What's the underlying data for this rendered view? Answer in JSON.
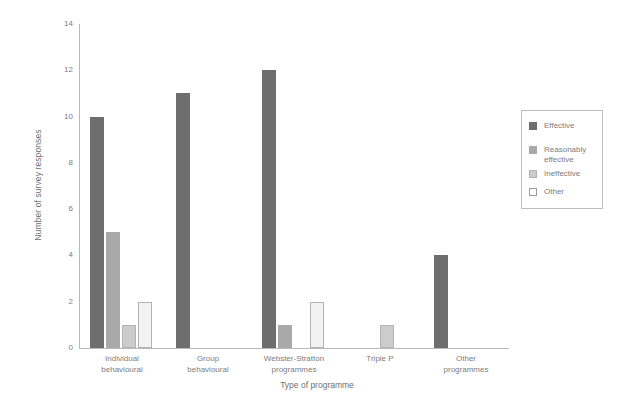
{
  "chart_data": {
    "type": "bar",
    "title": "",
    "xlabel": "Type of programme",
    "ylabel": "Number of survey responses",
    "ylim": [
      0,
      14
    ],
    "yticks": [
      0,
      2,
      4,
      6,
      8,
      10,
      12,
      14
    ],
    "grid": false,
    "legend_position": "right",
    "categories": [
      "Individual\nbehavioural",
      "Group\nbehavioural",
      "Webster-Stratton\nprogrammes",
      "Triple P",
      "Other\nprogrammes"
    ],
    "series": [
      {
        "name": "Effective",
        "color": "#6e6e6e",
        "values": [
          10,
          11,
          12,
          0,
          4
        ]
      },
      {
        "name": "Reasonably\neffective",
        "color": "#a9a9a9",
        "values": [
          5,
          0,
          1,
          0,
          0
        ]
      },
      {
        "name": "Ineffective",
        "color": "#cccccc",
        "values": [
          1,
          0,
          0,
          1,
          0
        ]
      },
      {
        "name": "Other",
        "color": "#f2f2f2",
        "values": [
          2,
          0,
          2,
          0,
          0
        ]
      }
    ]
  },
  "legend": {
    "entries": [
      {
        "label": "Effective"
      },
      {
        "label": "Reasonably\neffective"
      },
      {
        "label": "Ineffective"
      },
      {
        "label": "Other"
      }
    ]
  }
}
